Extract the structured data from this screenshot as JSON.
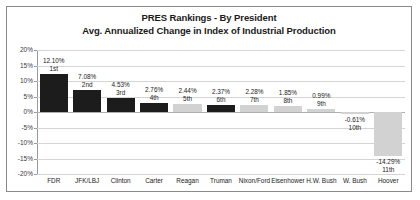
{
  "chart_data": {
    "type": "bar",
    "title": "PRES Rankings - By President",
    "subtitle": "Avg. Annualized Change in Index of Industrial Production",
    "xlabel": "",
    "ylabel": "",
    "ylim": [
      -20,
      20
    ],
    "grid": true,
    "legend": "none",
    "ytick_labels": [
      "20%",
      "15%",
      "10%",
      "5%",
      "0%",
      "-5%",
      "-10%",
      "-15%",
      "-20%"
    ],
    "ytick_values": [
      20,
      15,
      10,
      5,
      0,
      -5,
      -10,
      -15,
      -20
    ],
    "categories": [
      "FDR",
      "JFK/LBJ",
      "Clinton",
      "Carter",
      "Reagan",
      "Truman",
      "Nixon/Ford",
      "Eisenhower",
      "H.W. Bush",
      "W. Bush",
      "Hoover"
    ],
    "values": [
      12.1,
      7.08,
      4.53,
      2.76,
      2.44,
      2.37,
      2.28,
      1.85,
      0.99,
      -0.61,
      -14.29
    ],
    "value_labels": [
      "12.10%",
      "7.08%",
      "4.53%",
      "2.76%",
      "2.44%",
      "2.37%",
      "2.28%",
      "1.85%",
      "0.99%",
      "-0.61%",
      "-14.29%"
    ],
    "rank_labels": [
      "1st",
      "2nd",
      "3rd",
      "4th",
      "5th",
      "6th",
      "7th",
      "8th",
      "9th",
      "10th",
      "11th"
    ],
    "bar_shades": [
      "dark",
      "dark",
      "dark",
      "dark",
      "light",
      "dark",
      "light",
      "light",
      "light",
      "light",
      "light"
    ],
    "colors": {
      "dark_bar": "#1c1c1c",
      "light_bar": "#d2d2d2",
      "gridline": "#d4d4d4",
      "axis": "#9a9a9a",
      "text": "#1a1a1a",
      "border": "#8a8a8a",
      "background": "#ffffff"
    }
  }
}
